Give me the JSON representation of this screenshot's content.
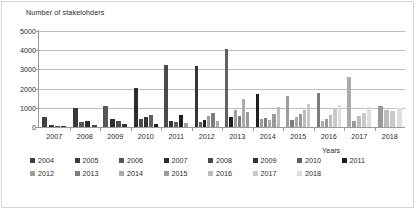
{
  "chart_data": {
    "type": "bar",
    "title": "",
    "ylabel": "Number of stakelohders",
    "xlabel": "Years",
    "ylim": [
      0,
      5000
    ],
    "ytick_labels": [
      "0",
      "1000",
      "2000",
      "3000",
      "4000",
      "5000"
    ],
    "ytick_values": [
      0,
      1000,
      2000,
      3000,
      4000,
      5000
    ],
    "grid": true,
    "legend_position": "bottom",
    "categories": [
      "2007",
      "2008",
      "2009",
      "2010",
      "2011",
      "2012",
      "2013",
      "2014",
      "2015",
      "2016",
      "2017",
      "2018"
    ],
    "series": [
      {
        "name": "2004",
        "color": "#404040",
        "values": [
          510,
          0,
          0,
          0,
          0,
          0,
          0,
          0,
          0,
          0,
          0,
          0
        ]
      },
      {
        "name": "2005",
        "color": "#3a3a3a",
        "values": [
          120,
          980,
          0,
          0,
          0,
          0,
          0,
          0,
          0,
          0,
          0,
          0
        ]
      },
      {
        "name": "2006",
        "color": "#585858",
        "values": [
          60,
          250,
          1090,
          0,
          0,
          0,
          0,
          0,
          0,
          0,
          0,
          0
        ]
      },
      {
        "name": "2007",
        "color": "#2e2e2e",
        "values": [
          55,
          330,
          420,
          2050,
          0,
          0,
          0,
          0,
          0,
          0,
          0,
          0
        ]
      },
      {
        "name": "2008",
        "color": "#4a4a4a",
        "values": [
          0,
          120,
          330,
          400,
          3210,
          0,
          0,
          0,
          0,
          0,
          0,
          0
        ]
      },
      {
        "name": "2009",
        "color": "#353535",
        "values": [
          0,
          0,
          180,
          520,
          300,
          3200,
          0,
          0,
          0,
          0,
          0,
          0
        ]
      },
      {
        "name": "2010",
        "color": "#606060",
        "values": [
          0,
          0,
          0,
          600,
          250,
          280,
          4050,
          0,
          0,
          0,
          0,
          0
        ]
      },
      {
        "name": "2011",
        "color": "#1f1f1f",
        "values": [
          0,
          0,
          0,
          180,
          620,
          360,
          510,
          1700,
          0,
          0,
          0,
          0
        ]
      },
      {
        "name": "2012",
        "color": "#9e9e9e",
        "values": [
          0,
          0,
          0,
          0,
          200,
          560,
          900,
          420,
          1640,
          0,
          0,
          0
        ]
      },
      {
        "name": "2013",
        "color": "#7d7d7d",
        "values": [
          0,
          0,
          0,
          0,
          0,
          740,
          560,
          480,
          340,
          1750,
          0,
          0
        ]
      },
      {
        "name": "2014",
        "color": "#ababab",
        "values": [
          0,
          0,
          0,
          0,
          0,
          300,
          1450,
          360,
          520,
          300,
          2600,
          0
        ]
      },
      {
        "name": "2015",
        "color": "#9a9a9a",
        "values": [
          0,
          0,
          0,
          0,
          0,
          0,
          780,
          680,
          700,
          430,
          320,
          1100
        ]
      },
      {
        "name": "2016",
        "color": "#bdbdbd",
        "values": [
          0,
          0,
          0,
          0,
          0,
          0,
          0,
          1050,
          880,
          640,
          560,
          900
        ]
      },
      {
        "name": "2017",
        "color": "#c9c9c9",
        "values": [
          0,
          0,
          0,
          0,
          0,
          0,
          0,
          0,
          1200,
          980,
          740,
          820
        ]
      },
      {
        "name": "2018",
        "color": "#dedede",
        "values": [
          0,
          0,
          0,
          0,
          0,
          0,
          0,
          0,
          0,
          1150,
          1050,
          1000
        ]
      }
    ]
  },
  "legend": {
    "rows": [
      [
        "2004",
        "2005",
        "2006",
        "2007",
        "2008",
        "2009",
        "2010",
        "2011"
      ],
      [
        "2012",
        "2013",
        "2014",
        "2015",
        "2016",
        "2017",
        "2018"
      ]
    ]
  }
}
